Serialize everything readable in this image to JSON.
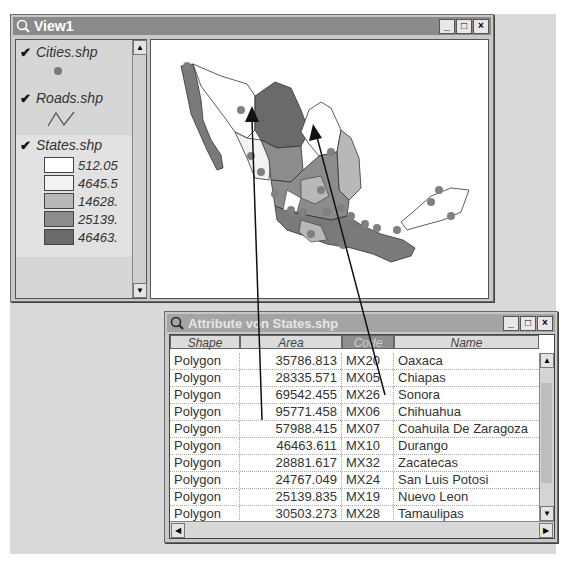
{
  "view_window": {
    "title": "View1",
    "controls": {
      "minimize": "_",
      "maximize": "□",
      "close": "×"
    },
    "toc": {
      "layers": [
        {
          "name": "Cities.shp",
          "checked": true,
          "symbol": "point",
          "color": "#7a7a7a"
        },
        {
          "name": "Roads.shp",
          "checked": true,
          "symbol": "line",
          "color": "#555555"
        },
        {
          "name": "States.shp",
          "checked": true,
          "symbol": "polygon",
          "active": true,
          "legend": [
            {
              "label": "512.05",
              "color": "#ffffff"
            },
            {
              "label": "4645.5",
              "color": "#f2f2f2"
            },
            {
              "label": "14628.",
              "color": "#b8b8b8"
            },
            {
              "label": "25139.",
              "color": "#8c8c8c"
            },
            {
              "label": "46463.",
              "color": "#6a6a6a"
            }
          ]
        }
      ],
      "scroll_up": "▲",
      "scroll_down": "▼"
    },
    "map": {
      "description": "Map of Mexico states shaded by area, with cities and roads"
    }
  },
  "attribute_window": {
    "title": "Attribute von States.shp",
    "controls": {
      "minimize": "_",
      "maximize": "□",
      "close": "×"
    },
    "columns": [
      {
        "label": "Shape",
        "selected": false
      },
      {
        "label": "Area",
        "selected": false
      },
      {
        "label": "Code",
        "selected": true
      },
      {
        "label": "Name",
        "selected": false
      }
    ],
    "rows": [
      {
        "shape": "Polygon",
        "area": "35786.813",
        "code": "MX20",
        "name": "Oaxaca"
      },
      {
        "shape": "Polygon",
        "area": "28335.571",
        "code": "MX05",
        "name": "Chiapas"
      },
      {
        "shape": "Polygon",
        "area": "69542.455",
        "code": "MX26",
        "name": "Sonora"
      },
      {
        "shape": "Polygon",
        "area": "95771.458",
        "code": "MX06",
        "name": "Chihuahua"
      },
      {
        "shape": "Polygon",
        "area": "57988.415",
        "code": "MX07",
        "name": "Coahuila De Zaragoza"
      },
      {
        "shape": "Polygon",
        "area": "46463.611",
        "code": "MX10",
        "name": "Durango"
      },
      {
        "shape": "Polygon",
        "area": "28881.617",
        "code": "MX32",
        "name": "Zacatecas"
      },
      {
        "shape": "Polygon",
        "area": "24767.049",
        "code": "MX24",
        "name": "San Luis Potosi"
      },
      {
        "shape": "Polygon",
        "area": "25139.835",
        "code": "MX19",
        "name": "Nuevo Leon"
      },
      {
        "shape": "Polygon",
        "area": "30503.273",
        "code": "MX28",
        "name": "Tamaulipas"
      },
      {
        "shape": "Polygon",
        "area": "27564.808",
        "code": "MX30",
        "name": "Veracruz Llave"
      }
    ],
    "scroll": {
      "up": "▲",
      "down": "▼",
      "left": "◀",
      "right": "▶"
    }
  }
}
